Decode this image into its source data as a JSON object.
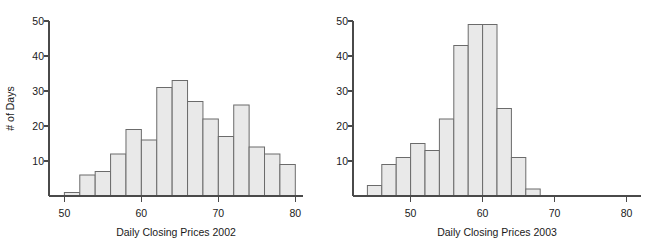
{
  "figure": {
    "background_color": "#ffffff",
    "bar_fill_color": "#e9e9e9",
    "bar_stroke_color": "#6b6b6b",
    "axis_color": "#4a4a4a",
    "partial_top_caption": ""
  },
  "chart_data": [
    {
      "type": "bar",
      "title": "",
      "xlabel": "Daily Closing Prices 2002",
      "ylabel": "# of Days",
      "xlim": [
        48,
        81
      ],
      "ylim": [
        0,
        50
      ],
      "grid": false,
      "legend": "none",
      "bin_width": 2,
      "bin_starts": [
        50,
        52,
        54,
        56,
        58,
        60,
        62,
        64,
        66,
        68,
        70,
        72,
        74,
        76,
        78
      ],
      "categories": [
        "50-52",
        "52-54",
        "54-56",
        "56-58",
        "58-60",
        "60-62",
        "62-64",
        "64-66",
        "66-68",
        "68-70",
        "70-72",
        "72-74",
        "74-76",
        "76-78",
        "78-80"
      ],
      "values": [
        1,
        6,
        7,
        12,
        19,
        16,
        31,
        33,
        27,
        22,
        17,
        26,
        14,
        12,
        9
      ],
      "xticks": [
        50,
        60,
        70,
        80
      ],
      "xtick_labels": [
        "50",
        "60",
        "70",
        "80"
      ],
      "yticks": [
        10,
        20,
        30,
        40,
        50
      ],
      "ytick_labels": [
        "10",
        "20",
        "30",
        "40",
        "50"
      ]
    },
    {
      "type": "bar",
      "title": "",
      "xlabel": "Daily Closing Prices 2003",
      "ylabel": "# of Days",
      "xlim": [
        42,
        82
      ],
      "ylim": [
        0,
        50
      ],
      "grid": false,
      "legend": "none",
      "bin_width": 2,
      "bin_starts": [
        44,
        46,
        48,
        50,
        52,
        54,
        56,
        58,
        60,
        62,
        64,
        66
      ],
      "categories": [
        "44-46",
        "46-48",
        "48-50",
        "50-52",
        "52-54",
        "54-56",
        "56-58",
        "58-60",
        "60-62",
        "62-64",
        "64-66",
        "66-68"
      ],
      "values": [
        3,
        9,
        11,
        15,
        13,
        22,
        43,
        49,
        49,
        25,
        11,
        2
      ],
      "xticks": [
        50,
        60,
        70,
        80
      ],
      "xtick_labels": [
        "50",
        "60",
        "70",
        "80"
      ],
      "yticks": [
        10,
        20,
        30,
        40,
        50
      ],
      "ytick_labels": [
        "10",
        "20",
        "30",
        "40",
        "50"
      ]
    }
  ]
}
